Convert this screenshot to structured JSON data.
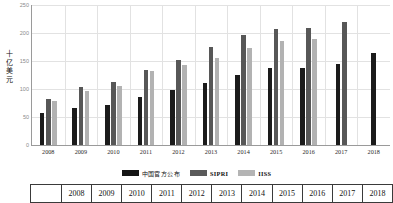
{
  "chart_data": {
    "type": "bar",
    "title": "",
    "xlabel": "",
    "ylabel": "十亿美元",
    "ylabel_chars": [
      "十",
      "亿",
      "美",
      "元"
    ],
    "ylim": [
      0,
      250
    ],
    "yticks": [
      0,
      50,
      100,
      150,
      200,
      250
    ],
    "grid": true,
    "legend_position": "bottom",
    "categories": [
      "2008",
      "2009",
      "2010",
      "2011",
      "2012",
      "2013",
      "2014",
      "2015",
      "2016",
      "2017",
      "2018"
    ],
    "series": [
      {
        "name": "中国官方公布",
        "color": "#1b1b1b",
        "values": [
          57,
          66,
          71,
          86,
          98,
          111,
          125,
          137,
          137,
          145,
          165
        ]
      },
      {
        "name": "SIPRI",
        "color": "#575757",
        "values": [
          83,
          103,
          112,
          134,
          152,
          175,
          196,
          207,
          209,
          220,
          null
        ]
      },
      {
        "name": "IISS",
        "color": "#b2b2b2",
        "values": [
          79,
          96,
          106,
          132,
          142,
          156,
          173,
          186,
          190,
          null,
          null
        ]
      }
    ]
  },
  "legend": {
    "items": [
      {
        "label": "中国官方公布",
        "color": "#151515",
        "script": "cjk"
      },
      {
        "label": "SIPRI",
        "color": "#5a5a5a",
        "script": "lat"
      },
      {
        "label": "IISS",
        "color": "#b4b4b4",
        "script": "lat"
      }
    ]
  },
  "bottom_table": {
    "header_row": [
      "",
      "2008",
      "2009",
      "2010",
      "2011",
      "2012",
      "2013",
      "2014",
      "2015",
      "2016",
      "2017",
      "2018"
    ]
  }
}
